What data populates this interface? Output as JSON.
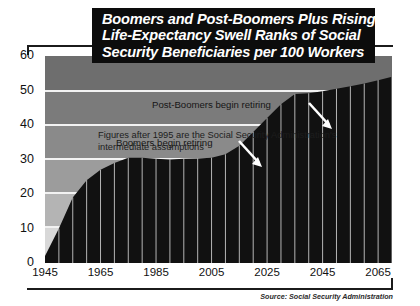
{
  "title": {
    "line1": "Boomers and Post-Boomers Plus Rising",
    "line2": "Life-Expectancy Swell Ranks of Social",
    "line3": "Security Beneficiaries per 100 Workers"
  },
  "source": "Source: Social Security Administration",
  "annotations": {
    "assumption_note_line1": "Figures after 1995 are the Social Security Administration's",
    "assumption_note_line2": "intermediate assumptions",
    "post_boomers": "Post-Boomers begin retiring",
    "boomers": "Boomers begin retiring"
  },
  "colors": {
    "title_plate": "#0c0c0c",
    "title_text": "#ffffff",
    "series_fill": "#111111",
    "gridline": "#f2f2f2",
    "arrow": "#ffffff",
    "axis_text": "#111111"
  },
  "chart_data": {
    "type": "area",
    "title": "Boomers and Post-Boomers Plus Rising Life-Expectancy Swell Ranks of Social Security Beneficiaries per 100 Workers",
    "xlabel": "",
    "ylabel": "",
    "xlim": [
      1945,
      2070
    ],
    "ylim": [
      0,
      60
    ],
    "yticks": [
      0,
      10,
      20,
      30,
      40,
      50,
      60
    ],
    "xticks": [
      1945,
      1965,
      1985,
      2005,
      2025,
      2045,
      2065
    ],
    "grid": "horizontal",
    "legend": "none",
    "series_name": "Beneficiaries per 100 workers",
    "x": [
      1945,
      1950,
      1955,
      1960,
      1965,
      1970,
      1975,
      1980,
      1985,
      1990,
      1995,
      2000,
      2005,
      2010,
      2015,
      2020,
      2025,
      2030,
      2035,
      2040,
      2045,
      2050,
      2055,
      2060,
      2065,
      2070
    ],
    "values": [
      2,
      10,
      19,
      24,
      27,
      29,
      30.5,
      30.5,
      30.2,
      30.0,
      30.2,
      30.3,
      30.5,
      31.5,
      34,
      38,
      42,
      46,
      49,
      49.2,
      49.8,
      50.5,
      51.2,
      52,
      53,
      54
    ]
  }
}
